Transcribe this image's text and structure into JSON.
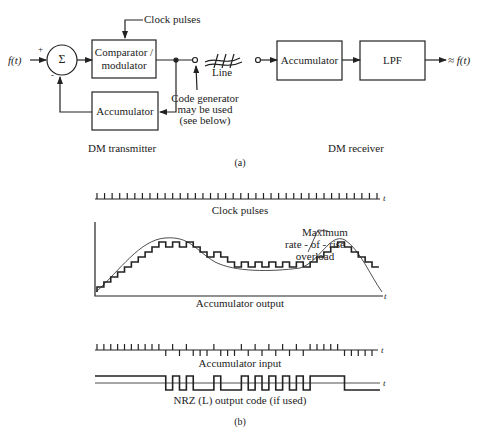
{
  "part_a": {
    "caption": "(a)",
    "transmitter": {
      "title": "DM transmitter",
      "input_label": "f(t)",
      "plus_sign": "+",
      "minus_sign": "-",
      "summer_symbol": "Σ",
      "comparator_line1": "Comparator /",
      "comparator_line2": "modulator",
      "accumulator_label": "Accumulator",
      "clock_label": "Clock pulses",
      "line_label": "Line",
      "code_gen_line1": "Code generator",
      "code_gen_line2": "may be used",
      "code_gen_line3": "(see below)"
    },
    "receiver": {
      "title": "DM receiver",
      "accumulator_label": "Accumulator",
      "lpf_label": "LPF",
      "output_label": "≈ f(t)"
    }
  },
  "part_b": {
    "caption": "(b)",
    "clock_label": "Clock pulses",
    "accumulator_output_label": "Accumulator output",
    "overload_line1": "Maximum",
    "overload_line2": "rate - of - rise",
    "overload_line3": "overload",
    "accumulator_input_label": "Accumulator input",
    "nrz_label": "NRZ (L) output code (if used)",
    "time_axis_label": "t"
  },
  "chart_data": {
    "type": "line",
    "clock_pulse_count": 38,
    "accumulator_input_bits": [
      1,
      1,
      1,
      1,
      1,
      1,
      1,
      1,
      1,
      1,
      0,
      1,
      0,
      1,
      0,
      0,
      0,
      1,
      0,
      0,
      0,
      1,
      0,
      1,
      0,
      1,
      0,
      1,
      0,
      1,
      0,
      1,
      1,
      1,
      1,
      1,
      0,
      0,
      0,
      0,
      0
    ],
    "annotations": [
      "Maximum rate-of-rise overload"
    ],
    "xlabel": "t",
    "series": [
      {
        "name": "Accumulator output",
        "kind": "staircase"
      },
      {
        "name": "Accumulator input",
        "kind": "bipolar impulses"
      },
      {
        "name": "NRZ (L) output code (if used)",
        "kind": "square"
      }
    ]
  }
}
